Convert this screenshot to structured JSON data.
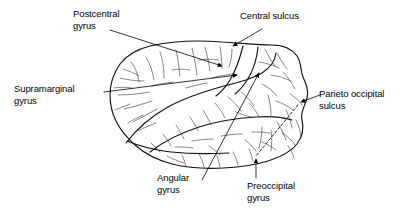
{
  "figure": {
    "background_color": "#ffffff",
    "ink_color": "#000000",
    "width": 410,
    "height": 212
  },
  "labels": [
    {
      "id": "postcentral-gyrus",
      "text": "Postcentral\ngyrus",
      "x": 73,
      "y": 8,
      "align": "left"
    },
    {
      "id": "central-sulcus",
      "text": "Central sulcus",
      "x": 240,
      "y": 10,
      "align": "left"
    },
    {
      "id": "supramarginal-gyrus",
      "text": "Supramarginal\ngyrus",
      "x": 14,
      "y": 83,
      "align": "left"
    },
    {
      "id": "parieto-occipital-sulcus",
      "text": "Parieto occipital\nsulcus",
      "x": 319,
      "y": 88,
      "align": "left"
    },
    {
      "id": "angular-gyrus",
      "text": "Angular\ngyrus",
      "x": 157,
      "y": 172,
      "align": "left"
    },
    {
      "id": "preoccipital-gyrus",
      "text": "Preoccipital\ngyrus",
      "x": 247,
      "y": 180,
      "align": "left"
    }
  ],
  "leaders": [
    {
      "id": "leader-postcentral-gyrus",
      "style": "solid",
      "arrow": true
    },
    {
      "id": "leader-central-sulcus",
      "style": "solid",
      "arrow": true
    },
    {
      "id": "leader-supramarginal-gyrus",
      "style": "solid",
      "arrow": true
    },
    {
      "id": "leader-parieto-occipital-sulcus",
      "style": "solid",
      "arrow": true
    },
    {
      "id": "leader-angular-gyrus",
      "style": "solid",
      "arrow": true
    },
    {
      "id": "leader-preoccipital-gyrus",
      "style": "solid",
      "arrow": true
    },
    {
      "id": "parieto-preoccipital-dashed-line",
      "style": "dashed",
      "arrow": false
    }
  ]
}
